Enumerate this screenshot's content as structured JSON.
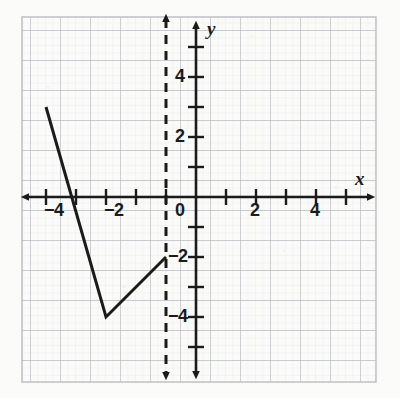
{
  "figure": {
    "title": "",
    "kind": "coordinate-plane-graph",
    "background_color": "#fbfbfa",
    "ink_color": "#1b1b1b",
    "grid_major_color": "#b9bcc2",
    "grid_minor_color": "#e2e4e8",
    "border_color": "#b9bcc2"
  },
  "axes": {
    "x_axis_label": "x",
    "y_axis_label": "y",
    "origin_label": "0",
    "x_tick_labels": [
      "−4",
      "−2",
      "2",
      "4"
    ],
    "x_tick_values": [
      -4,
      -2,
      2,
      4
    ],
    "y_tick_labels": [
      "4",
      "2",
      "2",
      "4"
    ],
    "y_tick_values": [
      4,
      2,
      -2,
      -4
    ],
    "y_negative_labels": [
      "−2",
      "−4"
    ],
    "x_range": [
      -6,
      6
    ],
    "y_range": [
      -6,
      6
    ],
    "unit_px": 30,
    "grid": "on",
    "arrowheads": "both-ends-both-axes"
  },
  "chart_data": {
    "type": "line",
    "title": "",
    "xlabel": "x",
    "ylabel": "y",
    "xlim": [
      -6,
      6
    ],
    "ylim": [
      -6,
      6
    ],
    "grid": true,
    "legend": "none",
    "series": [
      {
        "name": "v-shaped piecewise graph",
        "style": "solid",
        "color": "#1b1b1b",
        "width_px": 3,
        "points": [
          {
            "x": -5,
            "y": 3
          },
          {
            "x": -3,
            "y": -4
          },
          {
            "x": -1,
            "y": -2
          }
        ]
      },
      {
        "name": "vertical dashed line",
        "style": "dashed",
        "color": "#1b1b1b",
        "width_px": 3,
        "equation": "x = -1",
        "x": -1,
        "y_from": -6,
        "y_to": 6,
        "arrowheads": "both"
      }
    ],
    "annotations": []
  }
}
